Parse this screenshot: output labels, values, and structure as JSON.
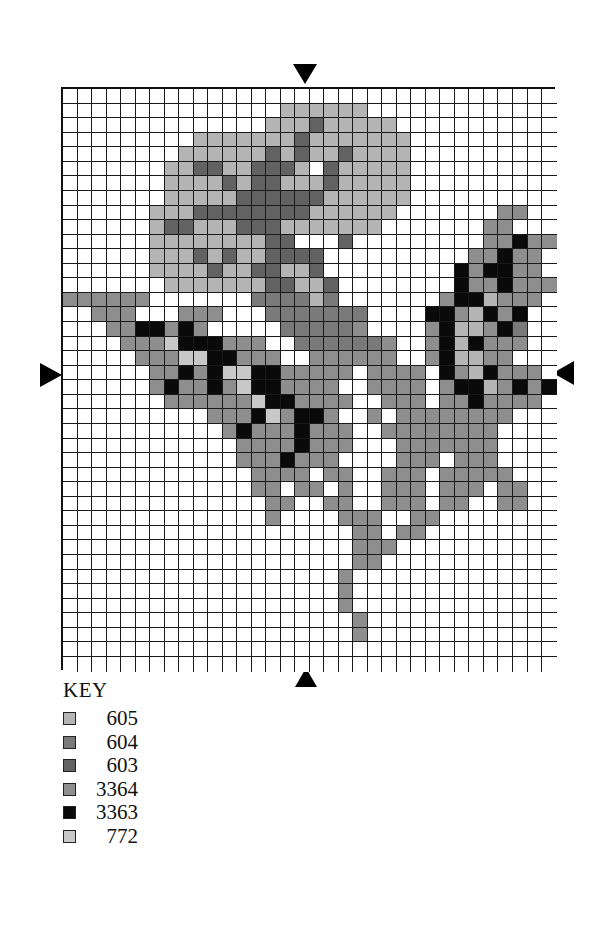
{
  "chart_data": {
    "type": "cross-stitch-pattern",
    "title": "",
    "grid": {
      "columns": 34,
      "rows": 40
    },
    "center_markers": [
      "top",
      "bottom",
      "left",
      "right"
    ],
    "key_title": "KEY",
    "legend": [
      {
        "symbol": "a",
        "code": "605",
        "color": "#b4b4b4"
      },
      {
        "symbol": "b",
        "code": "604",
        "color": "#7a7a7a"
      },
      {
        "symbol": "c",
        "code": "603",
        "color": "#626262"
      },
      {
        "symbol": "d",
        "code": "3364",
        "color": "#8e8e8e"
      },
      {
        "symbol": "e",
        "code": "3363",
        "color": "#0a0a0a"
      },
      {
        "symbol": "f",
        "code": "772",
        "color": "#c8c8c8"
      }
    ],
    "rows": [
      "..................................",
      "...............aaaaaa.............",
      "..............aaacaaaaa...........",
      ".........aaaaaaacaaaaaaa..........",
      "........aaaaaacacaacaaaa..........",
      ".......aaccaaccca.caaaaa..........",
      ".......aaaacaccaaacaaaaa..........",
      ".......aaaaaccccccaaaaaa..........",
      "......aaaccccccccaaaaaa.......dd..",
      "......accaaacccaaaaaaa.......dd...",
      "......aaaaaaaacc...c.........ddedd.",
      "......aaacacaacccc..........ddedd..",
      "......aaaacaaccaac.........edeedd..",
      ".......aaaaaaaccaac........eddeddd.",
      "dddddd.......bbbbab.......deeaddd..",
      "..ddd...ddd...bbbbbbb....eedaede...",
      "...ddeeded.....bbbbbd....deaadeb...",
      "....dddfeeeddd..bbbbbbd..deaeddd...",
      ".....dddffeeddd..dddddd..deaadd....",
      "......ddedeffeeddddd.dddd.edaeddd..",
      "......deddedfeedddd..dddd.deeadede.",
      ".......ddddddfeedddd..ddd.ddedddd..",
      "..........dddefdeed..d.dddddddd....",
      "...........dedddeddd..dddddddd.....",
      "............ddddeddd...ddddddd.....",
      "............dddeddd....ddd.ddd.....",
      ".............dddd.dd..ddd.ddddd....",
      ".............dd.dd.d..ddd.ddd.dd...",
      "..............dd..dd..ddd.dd..dd...",
      "..............d....ddd..dd.........",
      "....................dd.dd..........",
      "....................ddd............",
      "....................dd.............",
      "...................d...............",
      "...................d...............",
      "...................d...............",
      "....................d..............",
      "....................d..............",
      "..................................",
      ".................................."
    ]
  }
}
